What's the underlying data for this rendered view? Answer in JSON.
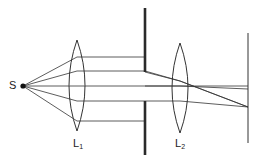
{
  "diagram": {
    "type": "optics-ray-diagram",
    "colors": {
      "line": "#333333",
      "screen": "#2a2a2a",
      "background": "#ffffff"
    },
    "source": {
      "label": "S",
      "x": 23,
      "y": 86
    },
    "lenses": [
      {
        "id": "L1",
        "label": "L",
        "subscript": "1",
        "x": 77,
        "top": 40,
        "bottom": 131,
        "half_width": 8
      },
      {
        "id": "L2",
        "label": "L",
        "subscript": "2",
        "x": 180,
        "top": 43,
        "bottom": 133,
        "half_width": 8
      }
    ],
    "aperture_screen": {
      "x": 145,
      "top": 8,
      "bottom": 155,
      "gap_top": 72,
      "gap_bottom": 101
    },
    "image_screen": {
      "x": 248,
      "top": 33,
      "bottom": 143
    },
    "rays_after_L1_y": [
      57,
      71,
      86,
      101,
      121
    ],
    "focus_point": {
      "x": 248,
      "y": 107
    },
    "central_ray_end_y": 89
  }
}
